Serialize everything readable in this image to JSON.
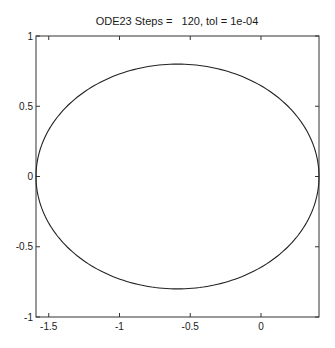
{
  "chart_data": {
    "type": "line",
    "title": "ODE23 Steps =   120, tol = 1e-04",
    "xlabel": "",
    "ylabel": "",
    "xlim": [
      -1.59,
      0.41
    ],
    "ylim": [
      -1,
      1
    ],
    "grid": false,
    "legend": null,
    "x_ticks": [
      -1.5,
      -1,
      -0.5,
      0
    ],
    "x_tick_labels": [
      "-1.5",
      "-1",
      "-0.5",
      "0"
    ],
    "y_ticks": [
      -1,
      -0.5,
      0,
      0.5,
      1
    ],
    "y_tick_labels": [
      "-1",
      "-0.5",
      "0",
      "0.5",
      "1"
    ],
    "series": [
      {
        "name": "trajectory",
        "shape": "ellipse",
        "center": [
          -0.59,
          0
        ],
        "semi_axis_x": 1.0,
        "semi_axis_y": 0.8,
        "color": "#222222",
        "points": [
          [
            0.41,
            0.0
          ],
          [
            0.276,
            0.4
          ],
          [
            -0.09,
            0.693
          ],
          [
            -0.59,
            0.8
          ],
          [
            -1.09,
            0.693
          ],
          [
            -1.456,
            0.4
          ],
          [
            -1.59,
            0.0
          ],
          [
            -1.456,
            -0.4
          ],
          [
            -1.09,
            -0.693
          ],
          [
            -0.59,
            -0.8
          ],
          [
            -0.09,
            -0.693
          ],
          [
            0.276,
            -0.4
          ]
        ]
      }
    ],
    "steps": 120,
    "tol": "1e-04"
  },
  "plot": {
    "title": "ODE23 Steps =   120, tol = 1e-04",
    "frame": {
      "left": 36,
      "top": 36,
      "right": 319,
      "bottom": 317
    },
    "line_color": "#222222",
    "axis_color": "#333333"
  }
}
